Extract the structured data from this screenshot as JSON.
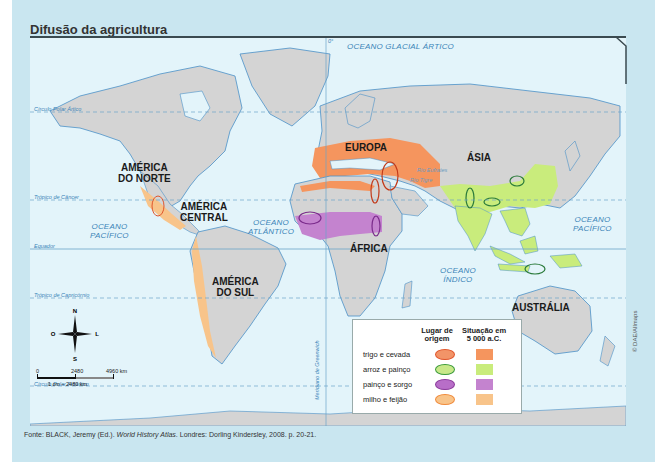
{
  "title": "Difusão da agricultura",
  "map": {
    "continents": [
      {
        "name": "AMÉRICA DO NORTE",
        "line1": "AMÉRICA",
        "line2": "DO NORTE"
      },
      {
        "name": "AMÉRICA CENTRAL",
        "line1": "AMÉRICA",
        "line2": "CENTRAL"
      },
      {
        "name": "AMÉRICA DO SUL",
        "line1": "AMÉRICA",
        "line2": "DO SUL"
      },
      {
        "name": "EUROPA",
        "line1": "EUROPA"
      },
      {
        "name": "ÁSIA",
        "line1": "ÁSIA"
      },
      {
        "name": "ÁFRICA",
        "line1": "ÁFRICA"
      },
      {
        "name": "AUSTRÁLIA",
        "line1": "AUSTRÁLIA"
      }
    ],
    "oceans": [
      {
        "line1": "OCEANO GLACIAL ÁRTICO"
      },
      {
        "line1": "OCEANO",
        "line2": "PACÍFICO"
      },
      {
        "line1": "OCEANO",
        "line2": "ATLÂNTICO"
      },
      {
        "line1": "OCEANO",
        "line2": "ÍNDICO"
      },
      {
        "line1": "OCEANO",
        "line2": "PACÍFICO"
      }
    ],
    "reference_lines": {
      "arctic_circle": "Círculo Polar Ártico",
      "tropic_cancer": "Trópico de Câncer",
      "equator": "Equador",
      "tropic_capricorn": "Trópico de Capricórnio",
      "antarctic_circle": "Círculo Polar Antártico",
      "greenwich": "Meridiano de Greenwich",
      "prime_meridian_degree": "0°"
    },
    "rivers": [
      "Rio Eufrates",
      "Rio Tigre",
      "Rio Indo",
      "Rio Ganges",
      "Rio Amarelo"
    ],
    "compass": {
      "n": "N",
      "s": "S",
      "o": "O",
      "l": "L"
    },
    "scale": {
      "ticks": [
        "0",
        "2480",
        "4960 km"
      ],
      "ratio": "1 cm – 2480 km"
    },
    "credit": "© DAE/Allmaps"
  },
  "legend": {
    "col_origin": "Lugar de origem",
    "col_origin_l1": "Lugar de",
    "col_origin_l2": "origem",
    "col_situation_l1": "Situação em",
    "col_situation_l2": "5 000 a.C.",
    "items": [
      {
        "label": "trigo e cevada",
        "stroke": "#e0552b",
        "fill": "#f29468",
        "area": "#f5955e"
      },
      {
        "label": "arroz e painço",
        "stroke": "#3a9a3a",
        "fill": "#c8e88a",
        "area": "#c9ec7c"
      },
      {
        "label": "painço e sorgo",
        "stroke": "#8b3a9b",
        "fill": "#b86ec8",
        "area": "#c483cf"
      },
      {
        "label": "milho e feijão",
        "stroke": "#f08a3a",
        "fill": "#f8c48a",
        "area": "#f8c48a"
      }
    ]
  },
  "source": {
    "prefix": "Fonte: BLACK, Jeremy (Ed.). ",
    "book": "World History Atlas",
    "suffix": ". Londres: Dorling Kindersley, 2008. p. 20-21."
  }
}
